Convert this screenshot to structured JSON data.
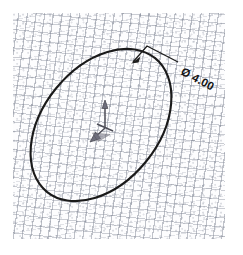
{
  "drawing": {
    "title": "Ellipse sketch with diameter dimension",
    "background_color": "#ffffff",
    "texture_color": "#7a8090",
    "line_color": "#1a1a1a",
    "axis_color": "#6e6e7c"
  },
  "dimension": {
    "symbol": "Ø",
    "value": "4.00",
    "full_label": "Ø 4.00",
    "rotation_degrees": 28
  },
  "shape": {
    "type": "ellipse",
    "center_x": 101,
    "center_y": 125,
    "radius_x": 86,
    "radius_y": 58,
    "rotation_degrees": 51
  },
  "origin_marker": {
    "label": "origin-triad",
    "x": 105,
    "y": 128
  },
  "leader": {
    "arrow_point_x": 133,
    "arrow_point_y": 62,
    "elbow_x": 147,
    "elbow_y": 46,
    "end_x": 178,
    "end_y": 62
  }
}
